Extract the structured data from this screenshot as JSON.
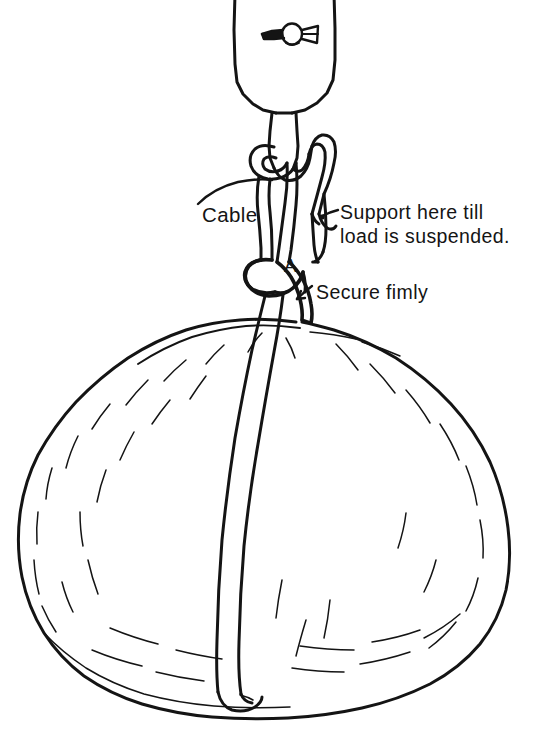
{
  "figure": {
    "ink_color": "#141414",
    "background_color": "#ffffff",
    "width": 558,
    "height": 732
  },
  "labels": {
    "cable": "Cable",
    "support_line1": "Support here till",
    "support_line2": "load is suspended.",
    "secure": "Secure fimly",
    "point_a": "A"
  },
  "parts": {
    "hook_block": "crane hook block",
    "retaining_pin": "hook block retaining pin and ring",
    "hook": "lifting hook",
    "sling_eye": "cable eye on hook",
    "sling_tail": "free end of cable",
    "choker_knot": "choker knot at point A",
    "load": "baled load"
  }
}
